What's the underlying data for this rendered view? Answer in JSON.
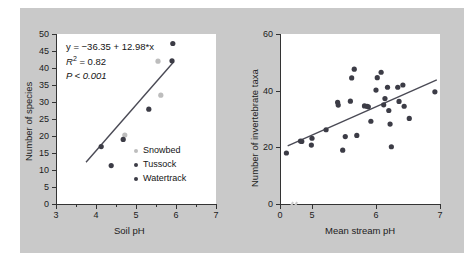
{
  "chart_data": [
    {
      "panel": "left",
      "type": "scatter",
      "title": "",
      "xlabel": "Soil pH",
      "ylabel": "Number of species",
      "xlim": [
        3,
        7
      ],
      "ylim": [
        0,
        50
      ],
      "xticks": [
        3,
        4,
        5,
        6,
        7
      ],
      "xticklabels": [
        "3",
        "4",
        "5",
        "6",
        "7"
      ],
      "yticks": [
        0,
        5,
        10,
        15,
        20,
        25,
        30,
        35,
        40,
        45,
        50
      ],
      "yticklabels": [
        "0",
        "5",
        "10",
        "15",
        "20",
        "25",
        "30",
        "35",
        "40",
        "45",
        "50"
      ],
      "grid": false,
      "annotations": {
        "equation": "y = −36.35 + 12.98*x",
        "r_squared_label": "R",
        "r_squared_sup": "2",
        "r_squared_value": " = 0.82",
        "p_value": "P < 0.001"
      },
      "legend": {
        "position": "lower-right",
        "entries": [
          {
            "label": "Snowbed",
            "color": "#bdbdbd"
          },
          {
            "label": "Tussock",
            "color": "#3c3c46"
          },
          {
            "label": "Watertrack",
            "color": "#3c3c46"
          }
        ]
      },
      "fit_line": {
        "x": [
          3.75,
          5.95
        ],
        "y": [
          12.3,
          41.9
        ],
        "color": "#4a4a55"
      },
      "series": [
        {
          "name": "Snowbed",
          "color": "#bdbdbd",
          "points": [
            {
              "x": 5.55,
              "y": 42.0
            },
            {
              "x": 5.62,
              "y": 32.0
            },
            {
              "x": 4.72,
              "y": 20.3
            }
          ]
        },
        {
          "name": "Tussock",
          "color": "#3c3c46",
          "points": [
            {
              "x": 4.13,
              "y": 16.9
            },
            {
              "x": 4.38,
              "y": 11.3
            },
            {
              "x": 4.68,
              "y": 19.0
            }
          ]
        },
        {
          "name": "Watertrack",
          "color": "#3c3c46",
          "points": [
            {
              "x": 5.32,
              "y": 27.9
            },
            {
              "x": 5.9,
              "y": 42.1
            },
            {
              "x": 5.92,
              "y": 47.2
            }
          ]
        }
      ]
    },
    {
      "panel": "right",
      "type": "scatter",
      "title": "",
      "xlabel": "Mean stream pH",
      "ylabel": "Number of invertebrate taxa",
      "xlim": [
        4.5,
        7.0
      ],
      "ylim": [
        0,
        60
      ],
      "xticks": [
        4.5,
        5,
        6,
        7
      ],
      "xticklabels": [
        "0",
        "5",
        "6",
        "7"
      ],
      "yticks": [
        0,
        20,
        40,
        60
      ],
      "yticklabels": [
        "0",
        "20",
        "40",
        "60"
      ],
      "axis_break": true,
      "grid": false,
      "fit_line": {
        "x": [
          4.62,
          6.95
        ],
        "y": [
          20.5,
          43.8
        ],
        "color": "#4a4a55"
      },
      "series": [
        {
          "name": "Stream sites",
          "color": "#3c3c46",
          "points": [
            {
              "x": 4.6,
              "y": 18.0
            },
            {
              "x": 4.82,
              "y": 22.2
            },
            {
              "x": 4.84,
              "y": 22.1
            },
            {
              "x": 5.0,
              "y": 23.2
            },
            {
              "x": 4.99,
              "y": 20.8
            },
            {
              "x": 5.22,
              "y": 26.2
            },
            {
              "x": 5.4,
              "y": 35.9
            },
            {
              "x": 5.41,
              "y": 34.9
            },
            {
              "x": 5.48,
              "y": 19.0
            },
            {
              "x": 5.52,
              "y": 23.8
            },
            {
              "x": 5.6,
              "y": 36.3
            },
            {
              "x": 5.62,
              "y": 44.5
            },
            {
              "x": 5.66,
              "y": 47.6
            },
            {
              "x": 5.7,
              "y": 24.2
            },
            {
              "x": 5.82,
              "y": 34.6
            },
            {
              "x": 5.86,
              "y": 34.5
            },
            {
              "x": 5.88,
              "y": 34.3
            },
            {
              "x": 5.92,
              "y": 29.2
            },
            {
              "x": 6.0,
              "y": 40.2
            },
            {
              "x": 6.02,
              "y": 44.6
            },
            {
              "x": 6.08,
              "y": 46.5
            },
            {
              "x": 6.12,
              "y": 35.0
            },
            {
              "x": 6.14,
              "y": 37.2
            },
            {
              "x": 6.18,
              "y": 41.2
            },
            {
              "x": 6.2,
              "y": 33.0
            },
            {
              "x": 6.22,
              "y": 28.2
            },
            {
              "x": 6.24,
              "y": 20.2
            },
            {
              "x": 6.34,
              "y": 41.2
            },
            {
              "x": 6.36,
              "y": 36.2
            },
            {
              "x": 6.42,
              "y": 42.0
            },
            {
              "x": 6.44,
              "y": 34.5
            },
            {
              "x": 6.52,
              "y": 30.2
            },
            {
              "x": 6.92,
              "y": 39.6
            }
          ]
        }
      ]
    }
  ]
}
